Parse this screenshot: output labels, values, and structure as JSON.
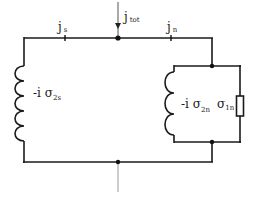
{
  "diagram": {
    "type": "equivalent-circuit",
    "labels": {
      "j_s": {
        "base": "j",
        "sub": "s"
      },
      "j_tot": {
        "base": "j",
        "sub": "tot"
      },
      "j_n": {
        "base": "j",
        "sub": "n"
      },
      "sigma_2s": {
        "prefix": "-i ",
        "base": "σ",
        "sub": "2s"
      },
      "sigma_2n": {
        "prefix": "-i ",
        "base": "σ",
        "sub": "2n"
      },
      "sigma_1n": {
        "base": "σ",
        "sub": "1n"
      }
    },
    "components": [
      {
        "id": "L_s",
        "kind": "inductor",
        "label": "-i σ2s",
        "branch": "superfluid"
      },
      {
        "id": "L_n",
        "kind": "inductor",
        "label": "-i σ2n",
        "branch": "normal"
      },
      {
        "id": "R_n",
        "kind": "resistor",
        "label": "σ1n",
        "branch": "normal"
      }
    ],
    "currents": [
      "j_tot",
      "j_s",
      "j_n"
    ],
    "colors": {
      "wire": "#1a1a1a",
      "lead": "#9a9a9a",
      "background": "#ffffff"
    }
  }
}
